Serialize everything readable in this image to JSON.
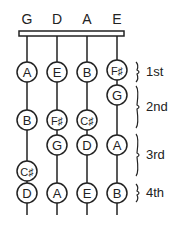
{
  "strings": [
    {
      "name": "G",
      "x": 27
    },
    {
      "name": "D",
      "x": 57
    },
    {
      "name": "A",
      "x": 87
    },
    {
      "name": "E",
      "x": 117
    }
  ],
  "notes": [
    {
      "string": 0,
      "label": "A",
      "y": 72
    },
    {
      "string": 0,
      "label": "B",
      "y": 120
    },
    {
      "string": 0,
      "label": "C♯",
      "y": 171
    },
    {
      "string": 0,
      "label": "D",
      "y": 193
    },
    {
      "string": 1,
      "label": "E",
      "y": 72
    },
    {
      "string": 1,
      "label": "F♯",
      "y": 120
    },
    {
      "string": 1,
      "label": "G",
      "y": 145
    },
    {
      "string": 1,
      "label": "A",
      "y": 193
    },
    {
      "string": 2,
      "label": "B",
      "y": 72
    },
    {
      "string": 2,
      "label": "C♯",
      "y": 120
    },
    {
      "string": 2,
      "label": "D",
      "y": 145
    },
    {
      "string": 2,
      "label": "E",
      "y": 193
    },
    {
      "string": 3,
      "label": "F♯",
      "y": 70
    },
    {
      "string": 3,
      "label": "G",
      "y": 95
    },
    {
      "string": 3,
      "label": "A",
      "y": 145
    },
    {
      "string": 3,
      "label": "B",
      "y": 193
    }
  ],
  "fingers": [
    {
      "label": "1st",
      "y1": 62,
      "y2": 82,
      "ly": 76
    },
    {
      "label": "2nd",
      "y1": 86,
      "y2": 128,
      "ly": 111
    },
    {
      "label": "3rd",
      "y1": 134,
      "y2": 176,
      "ly": 159
    },
    {
      "label": "4th",
      "y1": 184,
      "y2": 202,
      "ly": 197
    }
  ],
  "colors": {
    "ink": "#222222",
    "bg": "#ffffff"
  }
}
